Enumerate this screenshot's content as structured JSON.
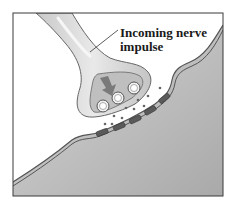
{
  "diagram": {
    "type": "synapse-illustration",
    "label": {
      "line1": "Incoming nerve",
      "line2": "impulse"
    },
    "elements": {
      "axon_terminal": "presynaptic axon terminal",
      "vesicles": 3,
      "postsynaptic_membrane": "receiving cell membrane",
      "receptors": 5,
      "arrow": "impulse direction arrow"
    },
    "colors": {
      "background": "#ffffff",
      "frame": "#3a3a3a",
      "axon_fill": "#d4d4d4",
      "axon_highlight": "#ececec",
      "terminal_inner": "#bdbdbd",
      "arrow": "#7a7a7a",
      "post_cell": "#b9b9b9",
      "membrane": "#555555",
      "receptor": "#5a5a5a",
      "neurotransmitter": "#666666"
    }
  }
}
